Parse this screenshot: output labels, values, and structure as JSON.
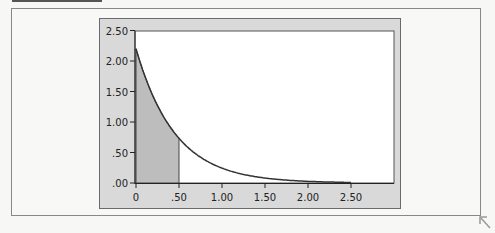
{
  "chart_data": {
    "type": "area",
    "title": "",
    "xlabel": "",
    "ylabel": "",
    "function": "exponential density f(x) = 2.2 * exp(-2.2 x)",
    "x": [
      0,
      0.25,
      0.5,
      0.75,
      1.0,
      1.25,
      1.5,
      1.75,
      2.0,
      2.25,
      2.5
    ],
    "series": [
      {
        "name": "density",
        "values": [
          2.2,
          1.27,
          0.73,
          0.42,
          0.24,
          0.14,
          0.08,
          0.05,
          0.03,
          0.02,
          0.01
        ]
      }
    ],
    "shaded_region": {
      "x_from": 0,
      "x_to": 0.5,
      "color": "#bdbdbd"
    },
    "xlim": [
      0,
      2.95
    ],
    "ylim": [
      0,
      2.5
    ],
    "xticks": [
      "0",
      ".50",
      "1.00",
      "1.50",
      "2.00",
      "2.50"
    ],
    "yticks": [
      "2.50",
      "2.00",
      "1.50",
      "1.00",
      ".50",
      ".00"
    ],
    "grid": false,
    "legend": null
  },
  "colors": {
    "panel": "#d9d9d9",
    "plot_bg": "#ffffff",
    "curve": "#333333",
    "shade": "#bdbdbd"
  },
  "axis": {
    "x_labels": [
      "0",
      ".50",
      "1.00",
      "1.50",
      "2.00",
      "2.50"
    ],
    "y_labels": [
      "2.50",
      "2.00",
      "1.50",
      "1.00",
      ".50",
      ".00"
    ]
  }
}
